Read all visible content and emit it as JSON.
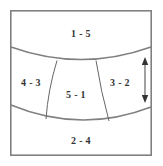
{
  "diagram": {
    "type": "region-partition-schematic",
    "frame": {
      "x": 10,
      "y": 10,
      "width": 142,
      "height": 146,
      "border_color": "#808080"
    },
    "label_color": "#333333",
    "divider_color": "#666666",
    "regions": [
      {
        "id": "region-top",
        "label": "1 - 5",
        "cx": 81,
        "cy": 35
      },
      {
        "id": "region-left",
        "label": "4 - 3",
        "cx": 31,
        "cy": 84
      },
      {
        "id": "region-center",
        "label": "5 - 1",
        "cx": 76,
        "cy": 96
      },
      {
        "id": "region-right",
        "label": "3 - 2",
        "cx": 120,
        "cy": 84
      },
      {
        "id": "region-bottom",
        "label": "2 - 4",
        "cx": 81,
        "cy": 142
      }
    ],
    "dimension_arrow": {
      "id": "vertical-dimension-arrow",
      "x": 145,
      "y_top": 58,
      "y_bottom": 102,
      "double_headed": true,
      "color": "#333333"
    }
  }
}
